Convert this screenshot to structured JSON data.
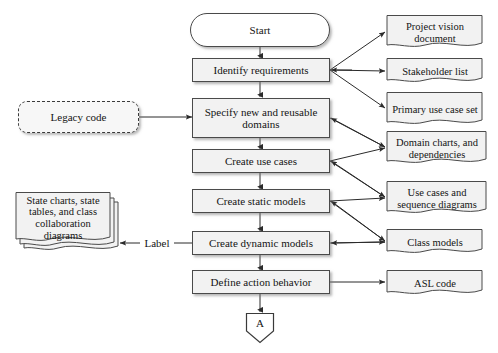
{
  "diagram": {
    "colors": {
      "process_fill": "#f2f2f2",
      "process_stroke": "#4a4a4a",
      "document_fill": "#f2f2f2",
      "terminator_fill": "#ffffff",
      "text": "#141414",
      "background": "#ffffff"
    },
    "start": {
      "label": "Start"
    },
    "process_steps": [
      {
        "label": "Identify requirements"
      },
      {
        "label": "Specify new and reusable domains"
      },
      {
        "label": "Create use cases"
      },
      {
        "label": "Create static models"
      },
      {
        "label": "Create dynamic models"
      },
      {
        "label": "Define action behavior"
      }
    ],
    "inputs": [
      {
        "label": "Legacy code"
      }
    ],
    "artifacts": [
      {
        "label": "Project vision document"
      },
      {
        "label": "Stakeholder list"
      },
      {
        "label": "Primary use case set"
      },
      {
        "label": "Domain charts, and dependencies"
      },
      {
        "label": "Use cases and sequence diagrams"
      },
      {
        "label": "Class models"
      },
      {
        "label": "ASL code"
      }
    ],
    "notes": [
      {
        "label": "State charts, state tables, and class collaboration diagrams"
      }
    ],
    "edge_labels": [
      {
        "label": "Label"
      }
    ],
    "connector": {
      "label": "A"
    }
  }
}
